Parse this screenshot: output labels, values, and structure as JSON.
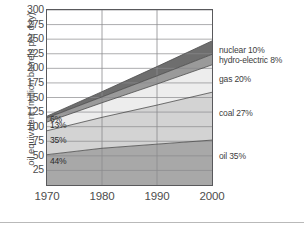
{
  "chart_data": {
    "type": "area",
    "title": "",
    "xlabel": "",
    "ylabel": "oil equivalent (million barrels per day)",
    "x": [
      1970,
      1980,
      1990,
      2000
    ],
    "xlim": [
      1970,
      2000
    ],
    "ylim": [
      0,
      300
    ],
    "ytick_values": [
      25,
      50,
      75,
      100,
      125,
      150,
      175,
      200,
      225,
      250,
      275,
      300
    ],
    "ytick_labels": [
      "25",
      "50",
      "75",
      "100",
      "125",
      "150",
      "175",
      "200",
      "225",
      "250",
      "275",
      "300"
    ],
    "xtick_values": [
      1970,
      1980,
      1990,
      2000
    ],
    "xtick_labels": [
      "1970",
      "1980",
      "1990",
      "2000"
    ],
    "grid": true,
    "legend_position": "right",
    "stacked": true,
    "stack_order_bottom_to_top": [
      "oil",
      "coal",
      "gas",
      "hydro-electric",
      "nuclear"
    ],
    "series": [
      {
        "name": "oil",
        "label": "oil 35%",
        "share_label": "35%",
        "inplot_label": "44%",
        "color": "#a8a8a8",
        "values": [
          52,
          63,
          70,
          77
        ]
      },
      {
        "name": "coal",
        "label": "coal 27%",
        "share_label": "27%",
        "inplot_label": "35%",
        "color": "#d3d3d3",
        "values": [
          41,
          53,
          67,
          82
        ]
      },
      {
        "name": "gas",
        "label": "gas 20%",
        "share_label": "20%",
        "inplot_label": "13%",
        "color": "#ededed",
        "values": [
          15,
          25,
          36,
          47
        ]
      },
      {
        "name": "hydro-electric",
        "label": "hydro-electric 8%",
        "share_label": "8%",
        "inplot_label": "6%",
        "color": "#9a9a9a",
        "values": [
          7,
          10,
          14,
          18
        ]
      },
      {
        "name": "nuclear",
        "label": "nuclear 10%",
        "share_label": "10%",
        "inplot_label": "",
        "color": "#6e6e6e",
        "values": [
          3,
          9,
          16,
          23
        ]
      }
    ],
    "cumulative_tops": {
      "oil": [
        52,
        63,
        70,
        77
      ],
      "coal": [
        93,
        116,
        137,
        159
      ],
      "gas": [
        108,
        141,
        173,
        206
      ],
      "hydro": [
        115,
        151,
        187,
        224
      ],
      "nuclear": [
        118,
        160,
        203,
        247
      ]
    },
    "inplot_labels": [
      {
        "text": "6%",
        "value": 112
      },
      {
        "text": "13%",
        "value": 101
      },
      {
        "text": "35%",
        "value": 75
      },
      {
        "text": "44%",
        "value": 39
      }
    ],
    "legend_entries": [
      {
        "text": "nuclear 10%",
        "value": 232
      },
      {
        "text": "hydro-electric 8%",
        "value": 215
      },
      {
        "text": "gas 20%",
        "value": 182
      },
      {
        "text": "coal 27%",
        "value": 124
      },
      {
        "text": "oil 35%",
        "value": 49
      }
    ],
    "colors": {
      "nuclear": "#6e6e6e",
      "hydro": "#9a9a9a",
      "gas": "#ededed",
      "coal": "#d3d3d3",
      "oil": "#a8a8a8",
      "grid": "#8a8a8d",
      "frame": "#59595c",
      "text": "#4d4d4d"
    }
  }
}
